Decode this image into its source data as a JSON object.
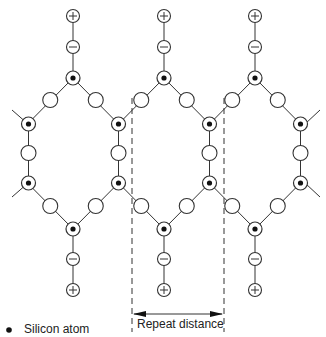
{
  "diagram": {
    "type": "silicon lattice chain diagram",
    "columns_x": [
      73,
      164,
      255
    ],
    "repeat_distance_px": 91,
    "rows": {
      "plus_top": 16,
      "minus_top": 47,
      "si_top": 78,
      "bond_upper": 100,
      "si_upper_side": 124,
      "bond_side": 153,
      "si_lower_side": 183,
      "bond_lower": 206,
      "si_bottom": 229,
      "minus_bottom": 259,
      "plus_bottom": 290
    },
    "dashed_lines_x": [
      132,
      224
    ],
    "arrow_y": 314,
    "colors": {
      "stroke": "#333333",
      "fill": "#ffffff",
      "dot": "#111111"
    }
  },
  "labels": {
    "repeat_distance": "Repeat distance",
    "legend_silicon": "Silicon atom"
  },
  "symbols": {
    "plus": "+",
    "minus": "−"
  }
}
